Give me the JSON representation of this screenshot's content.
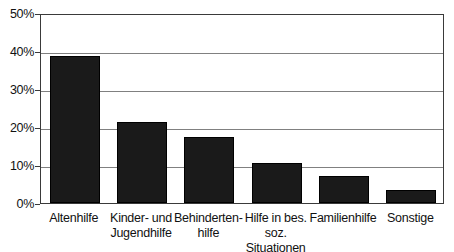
{
  "chart_data": {
    "type": "bar",
    "title": "",
    "subtitle": "",
    "xlabel": "",
    "ylabel": "",
    "ylim": [
      0,
      50
    ],
    "grid": true,
    "legend": false,
    "bar_color": "#1a1a1a",
    "gridline_color": "#808080",
    "axis_color": "#3a3a3a",
    "categories": [
      "Altenhilfe",
      "Kinder- und\nJugendhilfe",
      "Behinderten-\nhilfe",
      "Hilfe in bes.\nsoz. Situationen",
      "Familienhilfe",
      "Sonstige"
    ],
    "values": [
      38.7,
      21.3,
      17.4,
      10.6,
      7.1,
      3.4
    ],
    "value_unit": "%",
    "yticks": [
      0,
      10,
      20,
      30,
      40,
      50
    ],
    "ytick_labels": [
      "0%",
      "10%",
      "20%",
      "30%",
      "40%",
      "50%"
    ]
  }
}
